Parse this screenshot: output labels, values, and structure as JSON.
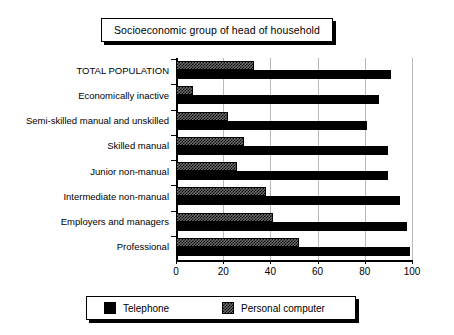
{
  "title": {
    "text": "Socioeconomic group of head of household"
  },
  "legend": {
    "position": "bottom",
    "items": [
      {
        "label": "Telephone",
        "swatch": "black-solid-swatch",
        "color": "#000000"
      },
      {
        "label": "Personal computer",
        "swatch": "gray-hatched-swatch",
        "color": "#6f6f6f"
      }
    ]
  },
  "axis": {
    "x_ticks": [
      "0",
      "20",
      "40",
      "60",
      "80",
      "100"
    ],
    "y_labels": [
      "TOTAL POPULATION",
      "Economically inactive",
      "Semi-skilled manual and unskilled",
      "Skilled manual",
      "Junior non-manual",
      "Intermediate non-manual",
      "Employers and managers",
      "Professional"
    ]
  },
  "chart_data": {
    "type": "bar",
    "orientation": "horizontal",
    "title": "Socioeconomic group of head of household",
    "xlabel": "",
    "ylabel": "",
    "xlim": [
      0,
      100
    ],
    "xticks": [
      0,
      20,
      40,
      60,
      80,
      100
    ],
    "grid": true,
    "grid_axis": "x",
    "legend_position": "bottom",
    "categories": [
      "TOTAL POPULATION",
      "Economically inactive",
      "Semi-skilled manual and unskilled",
      "Skilled manual",
      "Junior non-manual",
      "Intermediate non-manual",
      "Employers and managers",
      "Professional"
    ],
    "series": [
      {
        "name": "Telephone",
        "color": "#000000",
        "values": [
          91,
          86,
          81,
          90,
          90,
          95,
          98,
          99
        ]
      },
      {
        "name": "Personal computer",
        "color": "#6f6f6f",
        "values": [
          33,
          7,
          22,
          29,
          26,
          38,
          41,
          52
        ]
      }
    ]
  }
}
